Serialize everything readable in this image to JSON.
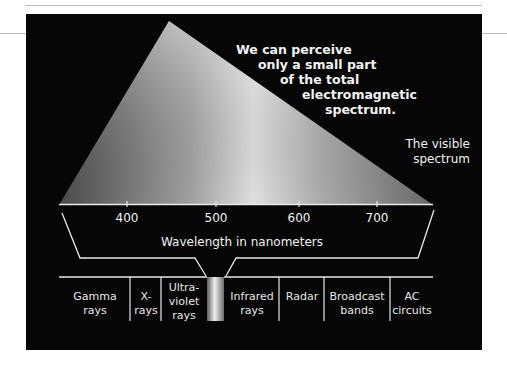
{
  "headline": {
    "lines": [
      "We can perceive",
      "only a small part",
      "of the total",
      "electromagnetic",
      "spectrum."
    ]
  },
  "visible_label": {
    "lines": [
      "The visible",
      "spectrum"
    ]
  },
  "axis": {
    "title": "Wavelength in nanometers",
    "unit": "nanometers",
    "ticks": [
      {
        "label": "400",
        "x": 127
      },
      {
        "label": "500",
        "x": 216
      },
      {
        "label": "600",
        "x": 299
      },
      {
        "label": "700",
        "x": 377
      }
    ]
  },
  "bands": [
    {
      "label": "Gamma\nrays",
      "cx": 95
    },
    {
      "label": "X-\nrays",
      "cx": 146
    },
    {
      "label": "Ultra-\nviolet\nrays",
      "cx": 184
    },
    {
      "label": "Infrared\nrays",
      "cx": 252
    },
    {
      "label": "Radar",
      "cx": 302
    },
    {
      "label": "Broadcast\nbands",
      "cx": 357
    },
    {
      "label": "AC\ncircuits",
      "cx": 412
    }
  ],
  "colors": {
    "panel_background": "#060606",
    "line": "#e8e8e8",
    "pyramid_dark": "#5a5a5a",
    "pyramid_light": "#e6e6e6"
  }
}
